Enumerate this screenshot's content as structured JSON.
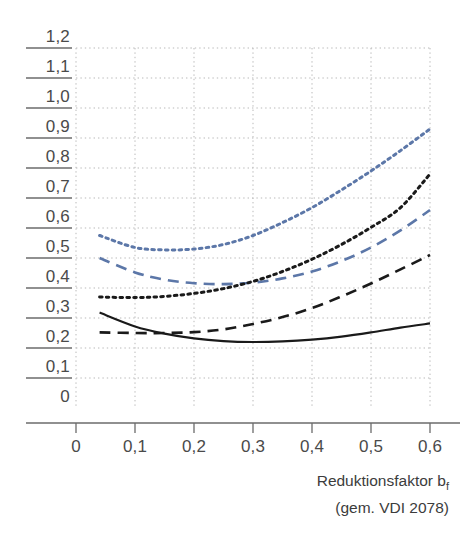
{
  "chart_data": {
    "type": "line",
    "title": "",
    "subtitle": "",
    "xlabel": "Reduktionsfaktor b_f (gem. VDI 2078)",
    "xlabel_main": "Reduktionsfaktor b",
    "xlabel_sub": "f",
    "xlabel_note": "(gem. VDI 2078)",
    "ylabel": "",
    "xlim": [
      0,
      0.6
    ],
    "ylim": [
      0,
      1.2
    ],
    "grid": true,
    "legend": "none",
    "x_ticks": [
      0,
      0.1,
      0.2,
      0.3,
      0.4,
      0.5,
      0.6
    ],
    "x_tick_labels": [
      "0",
      "0,1",
      "0,2",
      "0,3",
      "0,4",
      "0,5",
      "0,6"
    ],
    "y_ticks": [
      0,
      0.1,
      0.2,
      0.3,
      0.4,
      0.5,
      0.6,
      0.7,
      0.8,
      0.9,
      1.0,
      1.1,
      1.2
    ],
    "y_tick_labels": [
      "0",
      "0,1",
      "0,2",
      "0,3",
      "0,4",
      "0,5",
      "0,6",
      "0,7",
      "0,8",
      "0,9",
      "1,0",
      "1,1",
      "1,2"
    ],
    "x": [
      0.04,
      0.1,
      0.15,
      0.2,
      0.25,
      0.3,
      0.35,
      0.4,
      0.45,
      0.5,
      0.55,
      0.6
    ],
    "series": [
      {
        "name": "blue-dotted",
        "color": "#5c77a8",
        "style": "dotted",
        "values": [
          0.575,
          0.535,
          0.527,
          0.53,
          0.545,
          0.575,
          0.618,
          0.668,
          0.727,
          0.79,
          0.858,
          0.93
        ]
      },
      {
        "name": "blue-dashed",
        "color": "#5c77a8",
        "style": "dashed",
        "values": [
          0.5,
          0.452,
          0.428,
          0.416,
          0.413,
          0.418,
          0.432,
          0.455,
          0.49,
          0.535,
          0.592,
          0.66
        ]
      },
      {
        "name": "black-dotted",
        "color": "#1a1a1a",
        "style": "dotted",
        "values": [
          0.37,
          0.368,
          0.372,
          0.382,
          0.398,
          0.422,
          0.455,
          0.496,
          0.545,
          0.602,
          0.668,
          0.78
        ]
      },
      {
        "name": "black-dashed",
        "color": "#1a1a1a",
        "style": "dashed",
        "values": [
          0.252,
          0.25,
          0.25,
          0.253,
          0.262,
          0.28,
          0.303,
          0.333,
          0.372,
          0.415,
          0.462,
          0.51
        ]
      },
      {
        "name": "black-solid",
        "color": "#1a1a1a",
        "style": "solid",
        "values": [
          0.318,
          0.272,
          0.248,
          0.232,
          0.223,
          0.22,
          0.222,
          0.228,
          0.238,
          0.252,
          0.268,
          0.282
        ]
      }
    ]
  },
  "axes": {
    "x_axis_name": "reduktionsfaktor-axis",
    "y_axis_name": "value-axis"
  }
}
